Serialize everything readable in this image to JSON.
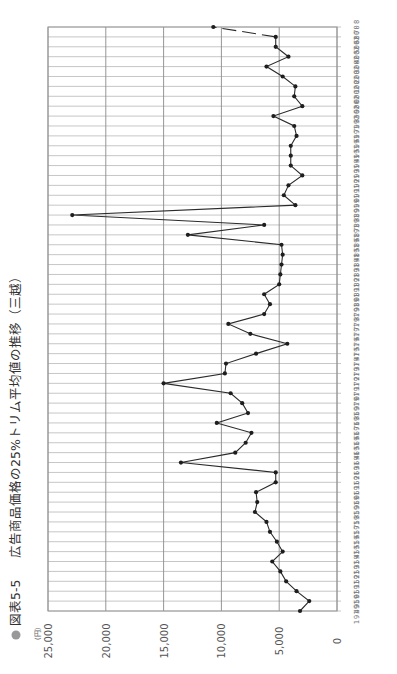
{
  "figure": {
    "bullet": "●",
    "label": "図表5-5",
    "title": "広告商品価格の25%トリム平均値の推移（三越）",
    "unit": "(円)"
  },
  "colors": {
    "line": "#2a2a2a",
    "point": "#1e1e1e",
    "grid": "#b8b8b8",
    "bullet": "#999999"
  },
  "chart_data": {
    "type": "line",
    "orientation": "rotated-90-ccw",
    "title": "広告商品価格の25%トリム平均値の推移（三越）",
    "figure_label": "図表5-5",
    "xlabel": "年",
    "ylabel": "(円)",
    "ylim": [
      0,
      25000
    ],
    "yticks": [
      0,
      5000,
      10000,
      15000,
      20000,
      25000
    ],
    "ytick_labels": [
      "0",
      "5,000",
      "10,000",
      "15,000",
      "20,000",
      "25,000"
    ],
    "grid": true,
    "legend": null,
    "categories": [
      "1949",
      "1950",
      "1951",
      "1952",
      "1953",
      "1954",
      "1955",
      "1956",
      "1957",
      "1958",
      "1959",
      "1960",
      "1961",
      "1962",
      "1963",
      "1964",
      "1965",
      "1966",
      "1967",
      "1968",
      "1969",
      "1970",
      "1971",
      "1972",
      "1973",
      "1974",
      "1975",
      "1976",
      "1977",
      "1978",
      "1979",
      "1980",
      "1981",
      "1982",
      "1983",
      "1984",
      "1985",
      "1986",
      "1987",
      "1988",
      "1989",
      "1990",
      "1991",
      "1992",
      "1993",
      "1994",
      "1995",
      "1996",
      "1997",
      "1998",
      "1999",
      "2000",
      "2001",
      "2002",
      "2003",
      "2004",
      "2005",
      "2006",
      "2007",
      "2008"
    ],
    "values": [
      3200,
      2400,
      3500,
      4400,
      4900,
      5600,
      4700,
      5200,
      5800,
      6100,
      7100,
      6900,
      7000,
      5300,
      5300,
      13500,
      8800,
      7900,
      7400,
      10400,
      7700,
      8200,
      9200,
      15000,
      9700,
      9600,
      7000,
      4300,
      7500,
      9400,
      6300,
      5800,
      6300,
      5000,
      4900,
      4800,
      4700,
      4800,
      12900,
      6300,
      22900,
      3600,
      4600,
      4200,
      3000,
      4000,
      4000,
      4000,
      3500,
      3700,
      5500,
      3000,
      3700,
      3600,
      4700,
      6100,
      4200,
      5300,
      5300,
      10700
    ],
    "annotations": [
      "2007→2008 segment drawn as broken/dashed line"
    ]
  }
}
